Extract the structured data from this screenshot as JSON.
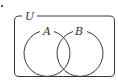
{
  "diagram": {
    "type": "venn",
    "universe_label": "U",
    "sets": [
      {
        "label": "A"
      },
      {
        "label": "B"
      }
    ],
    "stroke_color": "#3a3a3a",
    "background": "#ffffff"
  }
}
